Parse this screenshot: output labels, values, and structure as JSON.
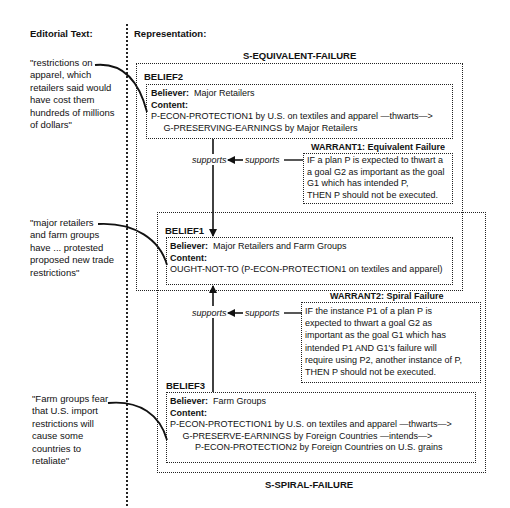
{
  "headers": {
    "editorial": "Editorial Text:",
    "representation": "Representation:"
  },
  "editorial_quotes": [
    {
      "text": "\"restrictions on\napparel, which\nretailers said would\nhave cost them\nhundreds of millions\nof dollars\""
    },
    {
      "text": "\"major retailers\nand farm groups\nhave ... protested\nproposed new trade\nrestrictions\""
    },
    {
      "text": "\"Farm groups fear\nthat U.S. import\nrestrictions will\ncause some\ncountries to\nretaliate\""
    }
  ],
  "strategies": {
    "equivalent": "S-EQUIVALENT-FAILURE",
    "spiral": "S-SPIRAL-FAILURE"
  },
  "beliefs": {
    "belief2": {
      "label": "BELIEF2",
      "believer_key": "Believer:",
      "believer": "Major Retailers",
      "content_key": "Content:",
      "content": "P-ECON-PROTECTION1 by U.S. on textiles and apparel —thwarts—>\n     G-PRESERVING-EARNINGS by Major Retailers"
    },
    "belief1": {
      "label": "BELIEF1",
      "believer_key": "Believer:",
      "believer": "Major Retailers and Farm Groups",
      "content_key": "Content:",
      "content": "OUGHT-NOT-TO (P-ECON-PROTECTION1 on textiles and apparel)"
    },
    "belief3": {
      "label": "BELIEF3",
      "believer_key": "Believer:",
      "believer": "Farm Groups",
      "content_key": "Content:",
      "content": "P-ECON-PROTECTION1 by U.S. on textiles and apparel —thwarts—>\n     G-PRESERVE-EARNINGS by Foreign Countries —intends—>\n          P-ECON-PROTECTION2 by Foreign Countries on U.S. grains"
    }
  },
  "warrants": {
    "warrant1": {
      "title": "WARRANT1: Equivalent Failure",
      "text": "IF a plan P is expected to thwart a\na goal G2 as important as the goal\nG1 which has intended P,\nTHEN P should not be executed."
    },
    "warrant2": {
      "title": "WARRANT2: Spiral Failure",
      "text": "IF the instance P1 of a plan P is\nexpected to thwart a goal G2 as\nimportant as the goal G1 which has\nintended P1 AND G1's failure will\nrequire using P2, another instance of P,\nTHEN P should not be executed."
    }
  },
  "links": {
    "supports_main": "supports",
    "supports_warrant": "supports"
  }
}
